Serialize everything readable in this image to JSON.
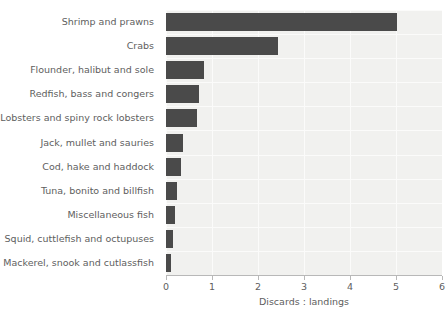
{
  "chart_data": {
    "type": "bar",
    "orientation": "horizontal",
    "title": "",
    "xlabel": "Discards : landings",
    "ylabel": "",
    "xlim": [
      0,
      6
    ],
    "ylim": null,
    "grid": true,
    "legend": null,
    "xticks": [
      "0",
      "1",
      "2",
      "3",
      "4",
      "5",
      "6"
    ],
    "categories": [
      "Shrimp and prawns",
      "Crabs",
      "Flounder, halibut and sole",
      "Redfish, bass and congers",
      "Lobsters and spiny rock lobsters",
      "Jack, mullet and sauries",
      "Cod, hake and haddock",
      "Tuna, bonito and billfish",
      "Miscellaneous fish",
      "Squid, cuttlefish and octupuses",
      "Mackerel, snook and cutlassfish"
    ],
    "values": [
      5.02,
      2.43,
      0.83,
      0.72,
      0.67,
      0.37,
      0.33,
      0.24,
      0.2,
      0.15,
      0.11
    ],
    "colors": {
      "bar": "#4a4a4a",
      "plot_background": "#f1f1ef",
      "grid": "#fbfbfa",
      "text": "#5e5e5e",
      "axis": "#b8b8b8",
      "figure_background": "#ffffff"
    }
  }
}
